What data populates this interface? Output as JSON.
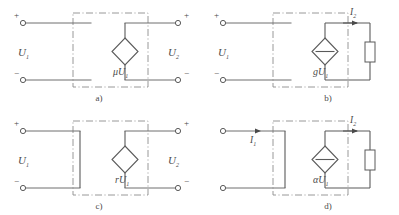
{
  "figure": {
    "background_color": "#ffffff",
    "line_color": "#6e6e6e",
    "boundary_style": "dash-dot"
  },
  "panels": [
    {
      "id": "a",
      "caption": "a)",
      "source_type": "voltage-controlled voltage source",
      "source_symbol": "diamond",
      "source_label": "μU",
      "source_label_sub": "1",
      "input_label": "U",
      "input_label_sub": "1",
      "output_label": "U",
      "output_label_sub": "2",
      "input_plus": "+",
      "input_minus": "−",
      "output_plus": "+",
      "output_minus": "−",
      "has_output_resistor": false,
      "has_input_short": false,
      "currents": []
    },
    {
      "id": "b",
      "caption": "b)",
      "source_type": "voltage-controlled current source",
      "source_symbol": "diamond-with-bar",
      "source_label": "gU",
      "source_label_sub": "1",
      "input_label": "U",
      "input_label_sub": "1",
      "output_label": "",
      "output_label_sub": "",
      "input_plus": "+",
      "input_minus": "−",
      "output_plus": "",
      "output_minus": "",
      "has_output_resistor": true,
      "has_input_short": false,
      "currents": [
        {
          "name": "I",
          "sub": "2",
          "direction": "right",
          "position": "output-top"
        }
      ]
    },
    {
      "id": "c",
      "caption": "c)",
      "source_type": "current-controlled voltage source",
      "source_symbol": "diamond",
      "source_label": "rU",
      "source_label_sub": "1",
      "input_label": "U",
      "input_label_sub": "1",
      "output_label": "U",
      "output_label_sub": "2",
      "input_plus": "+",
      "input_minus": "−",
      "output_plus": "+",
      "output_minus": "−",
      "has_output_resistor": false,
      "has_input_short": true,
      "currents": []
    },
    {
      "id": "d",
      "caption": "d)",
      "source_type": "current-controlled current source",
      "source_symbol": "diamond-with-bar",
      "source_label": "αU",
      "source_label_sub": "1",
      "input_label": "",
      "input_label_sub": "",
      "output_label": "",
      "output_label_sub": "",
      "input_plus": "",
      "input_minus": "",
      "output_plus": "",
      "output_minus": "",
      "has_output_resistor": true,
      "has_input_short": true,
      "currents": [
        {
          "name": "I",
          "sub": "1",
          "direction": "right",
          "position": "input-top"
        },
        {
          "name": "I",
          "sub": "2",
          "direction": "right",
          "position": "output-top"
        }
      ]
    }
  ]
}
